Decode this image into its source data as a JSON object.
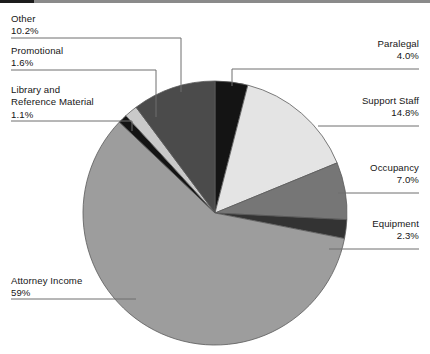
{
  "chart_data": {
    "type": "pie",
    "title": "",
    "categories": [
      "Paralegal",
      "Support Staff",
      "Occupancy",
      "Equipment",
      "Attorney Income",
      "Library and Reference Material",
      "Promotional",
      "Other"
    ],
    "values": [
      4.0,
      14.8,
      7.0,
      2.3,
      59,
      1.1,
      1.6,
      10.2
    ],
    "value_labels": [
      "4.0%",
      "14.8%",
      "7.0%",
      "2.3%",
      "59%",
      "1.1%",
      "1.6%",
      "10.2%"
    ],
    "units": "percent",
    "start_angle_deg": 0,
    "direction": "clockwise",
    "legend_position": "callout-labels",
    "grid": false,
    "colors": [
      "#141414",
      "#e4e4e4",
      "#767676",
      "#333333",
      "#9d9d9d",
      "#141414",
      "#c9c9c9",
      "#4b4b4b"
    ]
  },
  "labels": {
    "other": {
      "name": "Other",
      "pct": "10.2%"
    },
    "promotional": {
      "name": "Promotional",
      "pct": "1.6%"
    },
    "library": {
      "name_line1": "Library and",
      "name_line2": "Reference Material",
      "pct": "1.1%"
    },
    "attorney": {
      "name": "Attorney Income",
      "pct": "59%"
    },
    "paralegal": {
      "name": "Paralegal",
      "pct": "4.0%"
    },
    "support": {
      "name": "Support Staff",
      "pct": "14.8%"
    },
    "occupancy": {
      "name": "Occupancy",
      "pct": "7.0%"
    },
    "equipment": {
      "name": "Equipment",
      "pct": "2.3%"
    }
  },
  "style": {
    "leader_color": "#6f6f6f",
    "slice_outline": "#5a5a5a",
    "background": "#ffffff"
  }
}
